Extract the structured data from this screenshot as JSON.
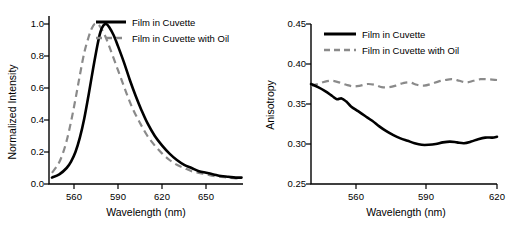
{
  "chart_data": [
    {
      "type": "line",
      "panel": "left",
      "title": "",
      "xlabel": "Wavelength (nm)",
      "ylabel": "Normalized Intensity",
      "xlim": [
        543,
        675
      ],
      "ylim": [
        0.0,
        1.05
      ],
      "xticks": [
        560,
        590,
        620,
        650
      ],
      "yticks": [
        "0.0",
        "0.2",
        "0.4",
        "0.6",
        "0.8",
        "1.0"
      ],
      "ytickvals": [
        0.0,
        0.2,
        0.4,
        0.6,
        0.8,
        1.0
      ],
      "grid": false,
      "legend_position": "top-right",
      "series": [
        {
          "name": "Film in Cuvette",
          "style": "solid",
          "color": "#000000",
          "points": [
            [
              545,
              0.04
            ],
            [
              550,
              0.06
            ],
            [
              555,
              0.1
            ],
            [
              558,
              0.14
            ],
            [
              561,
              0.2
            ],
            [
              564,
              0.29
            ],
            [
              567,
              0.41
            ],
            [
              570,
              0.56
            ],
            [
              573,
              0.72
            ],
            [
              576,
              0.87
            ],
            [
              578,
              0.95
            ],
            [
              580,
              0.99
            ],
            [
              582,
              1.0
            ],
            [
              584,
              0.98
            ],
            [
              587,
              0.93
            ],
            [
              590,
              0.86
            ],
            [
              594,
              0.76
            ],
            [
              598,
              0.65
            ],
            [
              602,
              0.55
            ],
            [
              606,
              0.46
            ],
            [
              610,
              0.38
            ],
            [
              615,
              0.3
            ],
            [
              620,
              0.24
            ],
            [
              625,
              0.19
            ],
            [
              630,
              0.15
            ],
            [
              635,
              0.12
            ],
            [
              640,
              0.1
            ],
            [
              645,
              0.08
            ],
            [
              650,
              0.07
            ],
            [
              655,
              0.06
            ],
            [
              660,
              0.05
            ],
            [
              665,
              0.045
            ],
            [
              670,
              0.04
            ],
            [
              674,
              0.04
            ]
          ]
        },
        {
          "name": "Film in Cuvette with Oil",
          "style": "dashed",
          "color": "#8a8a8a",
          "points": [
            [
              545,
              0.07
            ],
            [
              549,
              0.12
            ],
            [
              552,
              0.18
            ],
            [
              555,
              0.27
            ],
            [
              558,
              0.39
            ],
            [
              561,
              0.53
            ],
            [
              564,
              0.68
            ],
            [
              567,
              0.82
            ],
            [
              570,
              0.92
            ],
            [
              572,
              0.97
            ],
            [
              574,
              1.0
            ],
            [
              576,
              1.0
            ],
            [
              578,
              0.98
            ],
            [
              581,
              0.93
            ],
            [
              584,
              0.86
            ],
            [
              588,
              0.76
            ],
            [
              592,
              0.66
            ],
            [
              596,
              0.56
            ],
            [
              600,
              0.47
            ],
            [
              605,
              0.38
            ],
            [
              610,
              0.3
            ],
            [
              615,
              0.24
            ],
            [
              620,
              0.19
            ],
            [
              625,
              0.15
            ],
            [
              630,
              0.12
            ],
            [
              635,
              0.1
            ],
            [
              640,
              0.08
            ],
            [
              645,
              0.07
            ],
            [
              650,
              0.06
            ],
            [
              655,
              0.05
            ],
            [
              660,
              0.045
            ],
            [
              665,
              0.04
            ],
            [
              670,
              0.035
            ],
            [
              674,
              0.035
            ]
          ]
        }
      ]
    },
    {
      "type": "line",
      "panel": "right",
      "title": "",
      "xlabel": "Wavelength (nm)",
      "ylabel": "Anisotropy",
      "xlim": [
        541,
        620
      ],
      "ylim": [
        0.25,
        0.45
      ],
      "xticks": [
        560,
        590,
        620
      ],
      "yticks": [
        "0.25",
        "0.30",
        "0.35",
        "0.40",
        "0.45"
      ],
      "ytickvals": [
        0.25,
        0.3,
        0.35,
        0.4,
        0.45
      ],
      "grid": false,
      "legend_position": "top-left",
      "series": [
        {
          "name": "Film in Cuvette",
          "style": "solid",
          "color": "#000000",
          "points": [
            [
              541,
              0.375
            ],
            [
              544,
              0.371
            ],
            [
              547,
              0.366
            ],
            [
              550,
              0.36
            ],
            [
              552,
              0.356
            ],
            [
              554,
              0.357
            ],
            [
              556,
              0.353
            ],
            [
              558,
              0.347
            ],
            [
              561,
              0.341
            ],
            [
              564,
              0.335
            ],
            [
              567,
              0.329
            ],
            [
              570,
              0.322
            ],
            [
              573,
              0.316
            ],
            [
              576,
              0.311
            ],
            [
              579,
              0.307
            ],
            [
              582,
              0.304
            ],
            [
              585,
              0.301
            ],
            [
              588,
              0.299
            ],
            [
              591,
              0.299
            ],
            [
              594,
              0.3
            ],
            [
              597,
              0.302
            ],
            [
              600,
              0.303
            ],
            [
              603,
              0.302
            ],
            [
              606,
              0.301
            ],
            [
              609,
              0.303
            ],
            [
              612,
              0.306
            ],
            [
              615,
              0.308
            ],
            [
              618,
              0.308
            ],
            [
              620,
              0.309
            ]
          ]
        },
        {
          "name": "Film in Cuvette with Oil",
          "style": "dashed",
          "color": "#8a8a8a",
          "points": [
            [
              541,
              0.373
            ],
            [
              544,
              0.375
            ],
            [
              547,
              0.378
            ],
            [
              550,
              0.379
            ],
            [
              553,
              0.377
            ],
            [
              556,
              0.374
            ],
            [
              559,
              0.372
            ],
            [
              562,
              0.373
            ],
            [
              565,
              0.375
            ],
            [
              568,
              0.374
            ],
            [
              571,
              0.371
            ],
            [
              574,
              0.371
            ],
            [
              577,
              0.373
            ],
            [
              580,
              0.376
            ],
            [
              583,
              0.377
            ],
            [
              586,
              0.374
            ],
            [
              589,
              0.373
            ],
            [
              592,
              0.375
            ],
            [
              595,
              0.378
            ],
            [
              598,
              0.38
            ],
            [
              601,
              0.381
            ],
            [
              604,
              0.379
            ],
            [
              607,
              0.377
            ],
            [
              610,
              0.379
            ],
            [
              613,
              0.381
            ],
            [
              616,
              0.381
            ],
            [
              620,
              0.38
            ]
          ]
        }
      ]
    }
  ],
  "left": {
    "xlabel": "Wavelength (nm)",
    "ylabel": "Normalized Intensity",
    "legend": [
      {
        "label": "Film in Cuvette"
      },
      {
        "label": "Film in Cuvette with Oil"
      }
    ]
  },
  "right": {
    "xlabel": "Wavelength (nm)",
    "ylabel": "Anisotropy",
    "legend": [
      {
        "label": "Film in Cuvette"
      },
      {
        "label": "Film in Cuvette with Oil"
      }
    ]
  }
}
